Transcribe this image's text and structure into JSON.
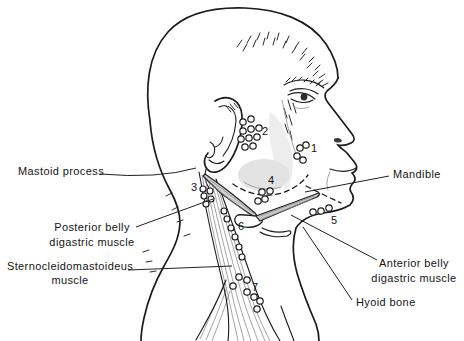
{
  "figure": {
    "kind": "anatomical line drawing, lateral view of head and neck with numbered lymph node groups"
  },
  "annotations": {
    "mastoid": {
      "label": "Mastoid process"
    },
    "posterior_digastric": {
      "line1": "Posterior belly",
      "line2": "digastric muscle"
    },
    "scm": {
      "line1": "Sternocleidomastoideus",
      "line2": "muscle"
    },
    "mandible": {
      "label": "Mandible"
    },
    "anterior_digastric": {
      "line1": "Anterior belly",
      "line2": "digastric muscle"
    },
    "hyoid": {
      "label": "Hyoid bone"
    }
  },
  "node_group_numbers": {
    "g1": "1",
    "g2": "2",
    "g3": "3",
    "g4": "4",
    "g5": "5",
    "g6": "6",
    "g7": "7"
  },
  "colors": {
    "ink": "#1b1b1b",
    "background": "#ffffff",
    "muscle_shade": "#cfcfcf",
    "gland_shade": "#e3e3e3"
  }
}
